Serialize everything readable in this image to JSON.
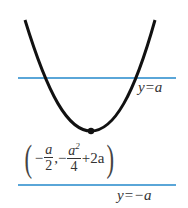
{
  "diagram": {
    "curve": {
      "type": "parabola",
      "opens": "up",
      "color": "#111111"
    },
    "lines": [
      {
        "label": "y=a",
        "y_px": 78,
        "color": "#5aa6d8"
      },
      {
        "label": "y=−a",
        "y_px": 185,
        "color": "#5aa6d8"
      }
    ],
    "vertex": {
      "label_parts": {
        "open": "(",
        "minus1": "−",
        "x_num": "a",
        "x_den": "2",
        "comma": ",",
        "minus2": "−",
        "y_num": "a",
        "y_num_exp": "2",
        "y_den": "4",
        "tail": "+2a",
        "close": ")"
      }
    },
    "labels": {
      "upper_line": "y=a",
      "lower_line": "y=−a"
    }
  }
}
